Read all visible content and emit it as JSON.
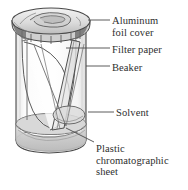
{
  "figure": {
    "type": "scientific-diagram",
    "background_color": "#ffffff",
    "ink_color": "#3a3a3a",
    "fill_light": "#e9e9e9",
    "fill_mid": "#d2d2d2",
    "fill_dark": "#9a9a9a"
  },
  "labels": {
    "aluminum_foil_cover": "Aluminum\nfoil cover",
    "filter_paper": "Filter paper",
    "beaker": "Beaker",
    "solvent": "Solvent",
    "plastic_sheet": "Plastic\nchromatographic\nsheet"
  },
  "parts": [
    {
      "name": "aluminum-foil-cover",
      "label": "Aluminum foil cover"
    },
    {
      "name": "filter-paper",
      "label": "Filter paper"
    },
    {
      "name": "beaker",
      "label": "Beaker"
    },
    {
      "name": "solvent",
      "label": "Solvent"
    },
    {
      "name": "plastic-chromatographic-sheet",
      "label": "Plastic chromatographic sheet"
    }
  ]
}
